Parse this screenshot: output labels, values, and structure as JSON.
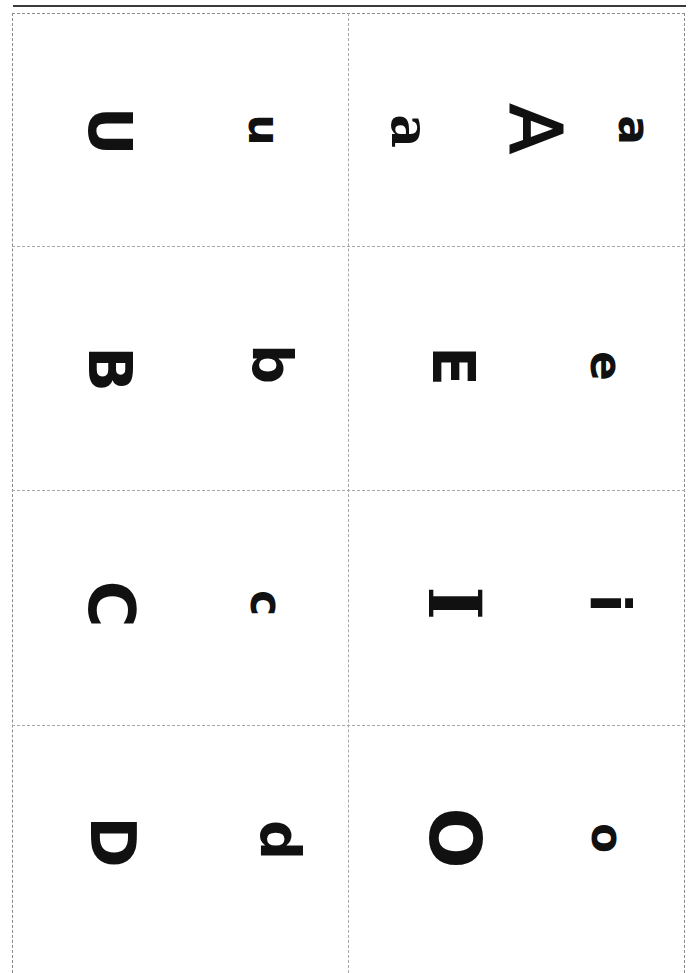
{
  "document": {
    "type": "alphabet flashcard sheet",
    "orientation": "rotated 90 degrees",
    "colors": {
      "ink": "#111111",
      "rule": "#3a3a3a",
      "cut_lines": "#a8a8a8",
      "background": "#ffffff"
    }
  },
  "cards": [
    {
      "position": "row1-left",
      "glyphs": [
        {
          "char": "U",
          "case": "upper"
        },
        {
          "char": "u",
          "case": "lower"
        }
      ]
    },
    {
      "position": "row1-right",
      "glyphs": [
        {
          "char": "a",
          "case": "lower-serif"
        },
        {
          "char": "A",
          "case": "upper"
        },
        {
          "char": "a",
          "case": "lower"
        }
      ]
    },
    {
      "position": "row2-left",
      "glyphs": [
        {
          "char": "B",
          "case": "upper"
        },
        {
          "char": "b",
          "case": "lower"
        }
      ]
    },
    {
      "position": "row2-right",
      "glyphs": [
        {
          "char": "E",
          "case": "upper"
        },
        {
          "char": "e",
          "case": "lower"
        }
      ]
    },
    {
      "position": "row3-left",
      "glyphs": [
        {
          "char": "C",
          "case": "upper"
        },
        {
          "char": "c",
          "case": "lower"
        }
      ]
    },
    {
      "position": "row3-right",
      "glyphs": [
        {
          "char": "I",
          "case": "upper"
        },
        {
          "char": "i",
          "case": "lower"
        }
      ]
    },
    {
      "position": "row4-left",
      "glyphs": [
        {
          "char": "D",
          "case": "upper"
        },
        {
          "char": "d",
          "case": "lower"
        }
      ]
    },
    {
      "position": "row4-right",
      "glyphs": [
        {
          "char": "O",
          "case": "upper"
        },
        {
          "char": "o",
          "case": "lower"
        }
      ]
    }
  ]
}
